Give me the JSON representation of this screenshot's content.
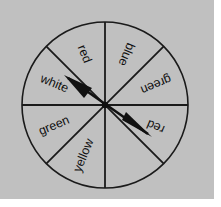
{
  "figure": {
    "name": "spinner-wheel",
    "background_color": "#c0c0c0",
    "page_color": "#ffffff",
    "line_color": "#1a1a1a",
    "text_color": "#111111"
  },
  "wheel": {
    "center_x": 105,
    "center_y": 105,
    "radius": 83,
    "sector_count": 8,
    "sectors": [
      {
        "index": 0,
        "label": "blue",
        "start_deg": 0,
        "end_deg": 45,
        "mid_deg": 22.5,
        "label_radius": 55,
        "label_rotation": 112.5
      },
      {
        "index": 1,
        "label": "green",
        "start_deg": 45,
        "end_deg": 90,
        "mid_deg": 67.5,
        "label_radius": 55,
        "label_rotation": 157.5
      },
      {
        "index": 2,
        "label": "red",
        "start_deg": 90,
        "end_deg": 135,
        "mid_deg": 112.5,
        "label_radius": 55,
        "label_rotation": 112.5
      },
      {
        "index": 3,
        "label": "yellow",
        "start_deg": 135,
        "end_deg": 180,
        "mid_deg": 157.5,
        "label_radius": 55,
        "label_rotation": 67.5
      },
      {
        "index": 4,
        "label": "green",
        "start_deg": 180,
        "end_deg": 225,
        "mid_deg": 202.5,
        "label_radius": 55,
        "label_rotation": 22.5
      },
      {
        "index": 5,
        "label": "white",
        "start_deg": 225,
        "end_deg": 270,
        "mid_deg": 247.5,
        "label_radius": 55,
        "label_rotation": -22.5
      },
      {
        "index": 6,
        "label": "red",
        "start_deg": 270,
        "end_deg": 315,
        "mid_deg": 292.5,
        "label_radius": 55,
        "label_rotation": -67.5
      },
      {
        "index": 7,
        "label": "blue",
        "start_deg": 315,
        "end_deg": 360,
        "mid_deg": 337.5,
        "label_radius": 55,
        "label_rotation": -112.5
      }
    ],
    "labels_clockwise_from_top": [
      "blue",
      "green",
      "red",
      "yellow",
      "green",
      "white",
      "red",
      "blue"
    ]
  },
  "pointer": {
    "name": "double-headed-arrow",
    "head_a_deg": 225,
    "head_b_deg": 40,
    "head_a_length": 52,
    "head_b_length": 46,
    "hub_radius": 3
  }
}
